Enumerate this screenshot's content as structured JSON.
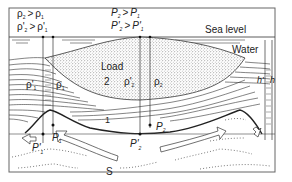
{
  "diagram": {
    "type": "geological-cross-section",
    "labels": {
      "sea_level": "Sea level",
      "water": "Water",
      "load": "Load",
      "load_number": "2",
      "layer_number": "1",
      "substrate": "S",
      "h_prime": "h'",
      "h": "h"
    },
    "relations": {
      "density_top_left_1": {
        "lhs": "ρ",
        "lhs_sub": "2",
        "op": ">",
        "rhs": "ρ",
        "rhs_sub": "1"
      },
      "density_top_left_2": {
        "lhs": "ρ'",
        "lhs_sub": "2",
        "op": ">",
        "rhs": "ρ'",
        "rhs_sub": "1"
      },
      "pressure_top_1": {
        "lhs": "P",
        "lhs_sub": "2",
        "op": ">",
        "rhs": "P",
        "rhs_sub": "1"
      },
      "pressure_top_2": {
        "lhs": "P'",
        "lhs_sub": "2",
        "op": ">",
        "rhs": "P'",
        "rhs_sub": "1"
      }
    },
    "column_labels": {
      "rho_prime_1": {
        "sym": "ρ'",
        "sub": "1"
      },
      "rho_1": {
        "sym": "ρ",
        "sub": "1"
      },
      "rho_prime_2": {
        "sym": "ρ'",
        "sub": "2"
      },
      "rho_2": {
        "sym": "ρ",
        "sub": "2"
      }
    },
    "points": {
      "P1": {
        "sym": "P",
        "sub": "1"
      },
      "P_prime_1": {
        "sym": "P'",
        "sub": "1"
      },
      "P2": {
        "sym": "P",
        "sub": "2"
      },
      "P_prime_2": {
        "sym": "P'",
        "sub": "2"
      }
    },
    "arrows": [
      "outward-left-hollow-arrow",
      "curved-flow-arrow-left",
      "curved-flow-arrow-right",
      "outward-right-hollow-arrow"
    ],
    "colors": {
      "line": "#222222",
      "frame": "#555555",
      "background": "#ffffff",
      "stipple": "#333333"
    }
  }
}
